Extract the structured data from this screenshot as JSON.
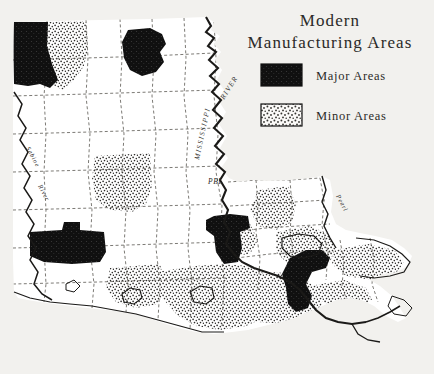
{
  "figure": {
    "title_line1": "Modern",
    "title_line2": "Manufacturing  Areas",
    "background_color": "#f2f1ee",
    "ink_color": "#1b1a18"
  },
  "legend": {
    "items": [
      {
        "label": "Major  Areas",
        "pattern": "solid-black",
        "color": "#111111"
      },
      {
        "label": "Minor  Areas",
        "pattern": "stipple",
        "color": "#3a3a3a"
      }
    ]
  },
  "map": {
    "region": "Louisiana",
    "labels": [
      {
        "name": "mississippi-river",
        "text": "MISSISSIPPI"
      },
      {
        "name": "mississippi-river-word-river",
        "text": "RIVER"
      },
      {
        "name": "sabine-river",
        "text": "Sabine"
      },
      {
        "name": "sabine-river-word-river",
        "text": "River"
      },
      {
        "name": "pearl-river",
        "text": "Pearl"
      },
      {
        "name": "pbl-label",
        "text": "PBL"
      }
    ],
    "major_areas": [
      {
        "name": "shreveport",
        "region": "northwest-corner"
      },
      {
        "name": "monroe",
        "region": "north-central"
      },
      {
        "name": "baton-rouge",
        "region": "south-central"
      },
      {
        "name": "lake-charles",
        "region": "southwest"
      },
      {
        "name": "new-orleans",
        "region": "southeast"
      }
    ],
    "minor_areas": [
      {
        "name": "north-shreveport-adjacent",
        "region": "northwest"
      },
      {
        "name": "alexandria",
        "region": "central"
      },
      {
        "name": "lafayette",
        "region": "south-central"
      },
      {
        "name": "coastal-parishes",
        "region": "south"
      },
      {
        "name": "northshore",
        "region": "southeast"
      },
      {
        "name": "delta-parishes",
        "region": "east"
      }
    ]
  }
}
